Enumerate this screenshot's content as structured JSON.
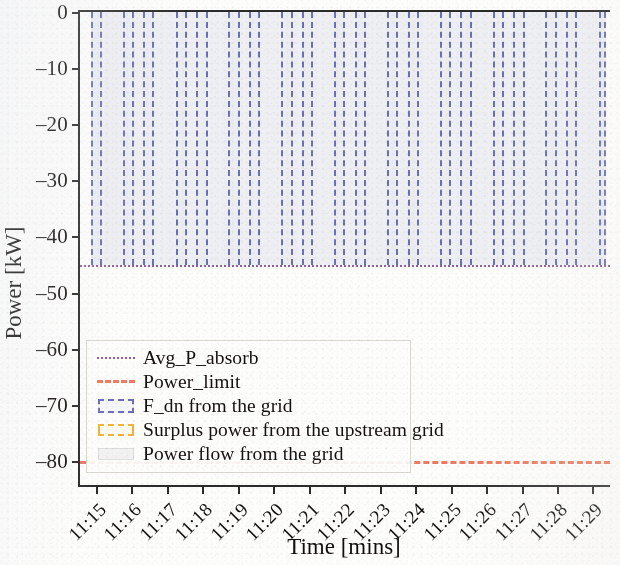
{
  "chart_data": {
    "type": "area",
    "title": "",
    "xlabel": "Time [mins]",
    "ylabel": "Power [kW]",
    "xlim": [
      0,
      15
    ],
    "ylim": [
      -85,
      0
    ],
    "grid": false,
    "legend_position": "center-left",
    "y_ticks": [
      "0",
      "–10",
      "–20",
      "–30",
      "–40",
      "–50",
      "–60",
      "–70",
      "–80"
    ],
    "y_tick_values": [
      0,
      -10,
      -20,
      -30,
      -40,
      -50,
      -60,
      -70,
      -80
    ],
    "x_ticks": [
      "11:15",
      "11:16",
      "11:17",
      "11:18",
      "11:19",
      "11:20",
      "11:21",
      "11:22",
      "11:23",
      "11:24",
      "11:25",
      "11:26",
      "11:27",
      "11:28",
      "11:29"
    ],
    "series": [
      {
        "name": "Avg_P_absorb",
        "style": "dotted-line",
        "color": "#8e5fa8",
        "value": -45,
        "values": [
          -45,
          -45,
          -45,
          -45,
          -45,
          -45,
          -45,
          -45,
          -45,
          -45,
          -45,
          -45,
          -45,
          -45,
          -45
        ]
      },
      {
        "name": "Power_limit",
        "style": "dashed-line",
        "color": "#ef7a61",
        "value": -80,
        "values": [
          -80,
          -80,
          -80,
          -80,
          -80,
          -80,
          -80,
          -80,
          -80,
          -80,
          -80,
          -80,
          -80,
          -80,
          -80
        ]
      },
      {
        "name": "F_dn from the grid",
        "style": "dashed-rect",
        "color": "#6b6fb5",
        "top": 0,
        "bottom": -45,
        "intervals": [
          [
            0.3,
            0.62
          ],
          [
            1.2,
            1.52
          ],
          [
            1.78,
            2.1
          ],
          [
            2.7,
            3.02
          ],
          [
            3.28,
            3.6
          ],
          [
            4.18,
            4.5
          ],
          [
            4.76,
            5.08
          ],
          [
            5.68,
            6.0
          ],
          [
            6.26,
            6.58
          ],
          [
            7.16,
            7.48
          ],
          [
            7.74,
            8.06
          ],
          [
            8.66,
            8.98
          ],
          [
            9.24,
            9.56
          ],
          [
            10.14,
            10.46
          ],
          [
            10.72,
            11.04
          ],
          [
            11.64,
            11.96
          ],
          [
            12.22,
            12.54
          ],
          [
            13.12,
            13.44
          ],
          [
            13.7,
            14.02
          ],
          [
            14.62,
            14.82
          ]
        ]
      },
      {
        "name": "Surplus power from the upstream grid",
        "style": "dashed-rect",
        "color": "#f0b43c",
        "intervals": []
      },
      {
        "name": "Power flow from the grid",
        "style": "filled-band",
        "color": "#e4e6ec",
        "top": 0,
        "bottom": -45,
        "intervals": [
          [
            0.3,
            14.82
          ]
        ]
      }
    ]
  },
  "axes": {
    "y_title": "Power [kW]",
    "x_title": "Time [mins]"
  },
  "legend": {
    "items": [
      {
        "label": "Avg_P_absorb",
        "marker": "dotted-line-purple-icon"
      },
      {
        "label": "Power_limit",
        "marker": "dashed-line-red-icon"
      },
      {
        "label": "F_dn from the grid",
        "marker": "dashed-box-blue-icon"
      },
      {
        "label": "Surplus power from the upstream grid",
        "marker": "dashed-box-orange-icon"
      },
      {
        "label": "Power flow from the grid",
        "marker": "filled-box-gray-icon"
      }
    ]
  }
}
